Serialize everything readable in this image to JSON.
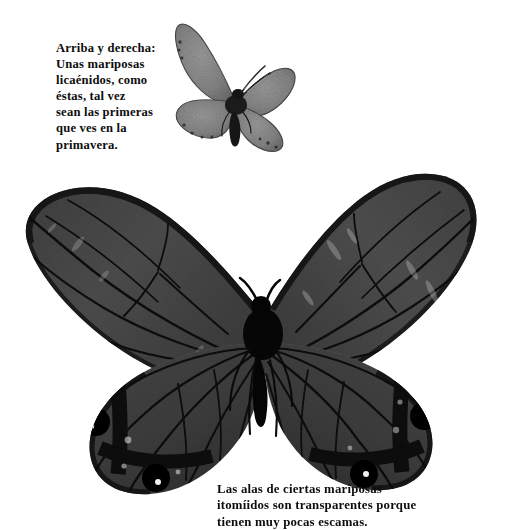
{
  "page": {
    "kind": "photographic-plate",
    "background_color": "#ffffff",
    "width": 506,
    "height": 530,
    "rendering": "black-and-white halftone photograph"
  },
  "captions": {
    "top": {
      "name": "caption-upper-right-butterfly",
      "full_text": "Arriba y derecha: Unas mariposas licaénidos, como éstas, tal vez sean las primeras que ves en la primavera.",
      "lines": [
        "Arriba y derecha:",
        "Unas mariposas",
        "licaénidos, como",
        "éstas, tal vez",
        "sean las primeras",
        "que ves en la",
        "primavera."
      ]
    },
    "bottom": {
      "name": "caption-transparent-wings",
      "full_text": "Las alas de ciertas mariposas itomíidos son transparentes porque tienen muy pocas escamas.",
      "lines": [
        "Las alas de ciertas mariposas",
        "itomíidos son transparentes porque",
        "tienen muy pocas escamas."
      ]
    }
  },
  "figures": [
    {
      "id": "lycaenid",
      "name": "small-butterfly-lycaenid",
      "label": "Mariposa licaénido",
      "description": "Small grey-brown lycaenid butterfly, wings spread, speckled scale texture, thin pale-banded antennae",
      "colors": {
        "wing_fill": "#8c8c8c",
        "wing_fill_dark": "#6f6f6f",
        "wing_edge": "#3a3a3a",
        "body": "#1d1d1d",
        "antenna": "#2b2b2b"
      }
    },
    {
      "id": "ithomiid",
      "name": "large-butterfly-ithomiid",
      "label": "Mariposa itomíido",
      "description": "Large clearwing ithomiid butterfly with semi-transparent dark grey wings, strong black veins, black hindwing bands and black eyespots with white pupils",
      "colors": {
        "forewing_fill": "#4a4a4a",
        "hindwing_fill": "#3f3f3f",
        "vein": "#0a0a0a",
        "wing_margin": "#151515",
        "band": "#080808",
        "eyespot": "#000000",
        "eyespot_pupil": "#f2f2f2",
        "body": "#070707"
      },
      "markings": {
        "eyespots": [
          {
            "wing": "left-hindwing",
            "position": "upper",
            "has_white_pupil": true
          },
          {
            "wing": "left-hindwing",
            "position": "lower",
            "has_white_pupil": true
          },
          {
            "wing": "right-hindwing",
            "position": "upper",
            "has_white_pupil": true
          },
          {
            "wing": "right-hindwing",
            "position": "lower",
            "has_white_pupil": true
          }
        ],
        "band_count_per_hindwing": 2
      }
    }
  ]
}
